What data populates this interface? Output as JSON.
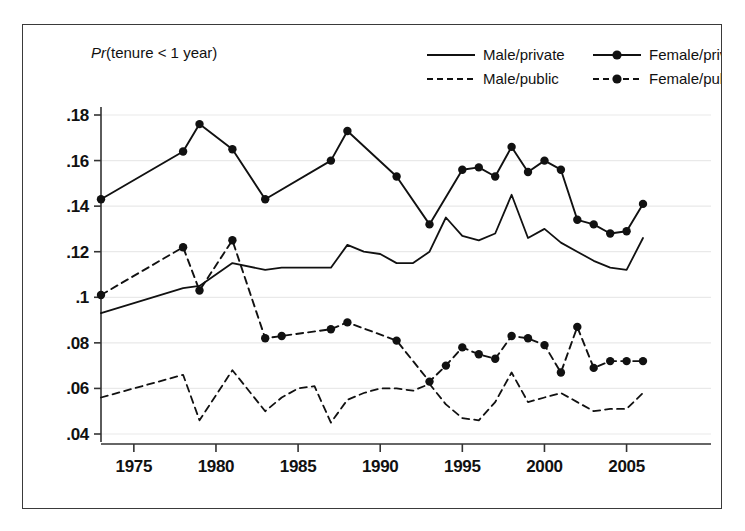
{
  "figure": {
    "note": "Pr(tenure < 1 year)",
    "note_italic_part": "Pr",
    "note_rest": "(tenure < 1 year)"
  },
  "legend": {
    "position": "top-right",
    "entries": [
      {
        "label": "Male/private",
        "style": "solid",
        "marker": "none",
        "color": "#111111"
      },
      {
        "label": "Female/private",
        "style": "solid",
        "marker": "circle",
        "color": "#111111"
      },
      {
        "label": "Male/public",
        "style": "dashed",
        "marker": "none",
        "color": "#111111"
      },
      {
        "label": "Female/public",
        "style": "dashed",
        "marker": "circle",
        "color": "#111111"
      }
    ]
  },
  "axes": {
    "y_ticks": [
      ".04",
      ".06",
      ".08",
      ".1",
      ".12",
      ".14",
      ".16",
      ".18"
    ],
    "y_tick_values": [
      0.04,
      0.06,
      0.08,
      0.1,
      0.12,
      0.14,
      0.16,
      0.18
    ],
    "x_ticks": [
      "1975",
      "1980",
      "1985",
      "1990",
      "1995",
      "2000",
      "2005"
    ],
    "x_tick_values": [
      1975,
      1980,
      1985,
      1990,
      1995,
      2000,
      2005
    ],
    "xlim": [
      1972,
      2007
    ],
    "ylim": [
      0.035,
      0.19
    ]
  },
  "chart_data": {
    "type": "line",
    "title": "",
    "subtitle": "",
    "xlabel": "",
    "ylabel": "",
    "annotation": "Pr(tenure < 1 year)",
    "grid": true,
    "legend_position": "top-right",
    "xlim": [
      1972,
      2007
    ],
    "ylim": [
      0.035,
      0.19
    ],
    "x": [
      1973,
      1978,
      1979,
      1980,
      1981,
      1983,
      1984,
      1985,
      1986,
      1987,
      1988,
      1989,
      1990,
      1991,
      1992,
      1993,
      1994,
      1995,
      1996,
      1997,
      1998,
      1999,
      2000,
      2001,
      2002,
      2003,
      2004,
      2005,
      2006
    ],
    "series": [
      {
        "name": "Male/private",
        "style": "solid",
        "marker": "none",
        "x": [
          1973,
          1978,
          1979,
          1981,
          1983,
          1984,
          1985,
          1986,
          1987,
          1988,
          1989,
          1990,
          1991,
          1992,
          1993,
          1994,
          1995,
          1996,
          1997,
          1998,
          1999,
          2000,
          2001,
          2002,
          2003,
          2004,
          2005,
          2006
        ],
        "values": [
          0.093,
          0.104,
          0.105,
          0.115,
          0.112,
          0.113,
          0.113,
          0.113,
          0.113,
          0.123,
          0.12,
          0.119,
          0.115,
          0.115,
          0.12,
          0.135,
          0.127,
          0.125,
          0.128,
          0.145,
          0.126,
          0.13,
          0.124,
          0.12,
          0.116,
          0.113,
          0.112,
          0.126
        ]
      },
      {
        "name": "Female/private",
        "style": "solid",
        "marker": "circle",
        "x": [
          1973,
          1978,
          1979,
          1981,
          1983,
          1987,
          1988,
          1991,
          1993,
          1995,
          1996,
          1997,
          1998,
          1999,
          2000,
          2001,
          2002,
          2003,
          2004,
          2005,
          2006
        ],
        "values": [
          0.143,
          0.164,
          0.176,
          0.165,
          0.143,
          0.16,
          0.173,
          0.153,
          0.132,
          0.156,
          0.157,
          0.153,
          0.166,
          0.155,
          0.16,
          0.156,
          0.134,
          0.132,
          0.128,
          0.129,
          0.141
        ]
      },
      {
        "name": "Male/public",
        "style": "dashed",
        "marker": "none",
        "x": [
          1973,
          1978,
          1979,
          1981,
          1983,
          1984,
          1985,
          1986,
          1987,
          1988,
          1989,
          1990,
          1991,
          1992,
          1993,
          1994,
          1995,
          1996,
          1997,
          1998,
          1999,
          2000,
          2001,
          2002,
          2003,
          2004,
          2005,
          2006
        ],
        "values": [
          0.056,
          0.066,
          0.046,
          0.068,
          0.05,
          0.056,
          0.06,
          0.061,
          0.045,
          0.055,
          0.058,
          0.06,
          0.06,
          0.059,
          0.062,
          0.053,
          0.047,
          0.046,
          0.054,
          0.067,
          0.054,
          0.056,
          0.058,
          0.054,
          0.05,
          0.051,
          0.051,
          0.058
        ]
      },
      {
        "name": "Female/public",
        "style": "dashed",
        "marker": "circle",
        "x": [
          1973,
          1978,
          1979,
          1981,
          1983,
          1984,
          1987,
          1988,
          1991,
          1993,
          1994,
          1995,
          1996,
          1997,
          1998,
          1999,
          2000,
          2001,
          2002,
          2003,
          2004,
          2005,
          2006
        ],
        "values": [
          0.101,
          0.122,
          0.103,
          0.125,
          0.082,
          0.083,
          0.086,
          0.089,
          0.081,
          0.063,
          0.07,
          0.078,
          0.075,
          0.073,
          0.083,
          0.082,
          0.079,
          0.067,
          0.087,
          0.069,
          0.072,
          0.072,
          0.072
        ]
      }
    ]
  }
}
